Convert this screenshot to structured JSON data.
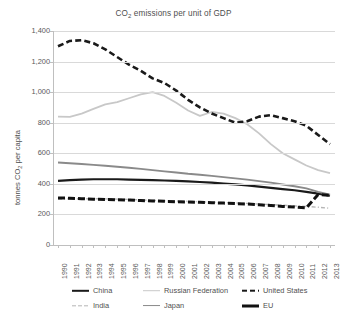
{
  "chart_data": {
    "type": "line",
    "title": "CO2 emissions per unit of GDP",
    "title_main": "CO",
    "title_sub": "2",
    "title_rest": " emissions per unit of GDP",
    "xlabel": "",
    "ylabel": "tonnes CO2 per capita",
    "ylabel_main": "tonnes CO",
    "ylabel_sub": "2",
    "ylabel_rest": " per capita",
    "ylim": [
      0,
      1400
    ],
    "ytick_labels": [
      "1,400",
      "1,200",
      "1,000",
      "800",
      "600",
      "400",
      "200",
      "0"
    ],
    "ytick_values": [
      1400,
      1200,
      1000,
      800,
      600,
      400,
      200,
      0
    ],
    "grid": true,
    "legend_position": "bottom",
    "x": [
      1990,
      1991,
      1992,
      1993,
      1994,
      1995,
      1996,
      1997,
      1998,
      1999,
      2000,
      2001,
      2002,
      2003,
      2004,
      2005,
      2006,
      2007,
      2008,
      2009,
      2010,
      2011,
      2012,
      2013
    ],
    "categories": [
      "1990",
      "1991",
      "1992",
      "1993",
      "1994",
      "1995",
      "1996",
      "1997",
      "1998",
      "1999",
      "2000",
      "2001",
      "2002",
      "2003",
      "2004",
      "2005",
      "2006",
      "2007",
      "2008",
      "2009",
      "2010",
      "2011",
      "2012",
      "2013"
    ],
    "series": [
      {
        "name": "China",
        "color": "#1a1a1a",
        "style": "solid",
        "width": 2.2,
        "values": [
          420,
          424,
          428,
          430,
          430,
          430,
          428,
          426,
          424,
          422,
          420,
          416,
          412,
          408,
          402,
          396,
          390,
          382,
          374,
          366,
          358,
          348,
          336,
          322
        ]
      },
      {
        "name": "Russian Federation",
        "color": "#c8c8c8",
        "style": "solid",
        "width": 1.8,
        "values": [
          840,
          838,
          860,
          890,
          920,
          935,
          960,
          985,
          1000,
          975,
          930,
          880,
          845,
          870,
          860,
          830,
          790,
          730,
          660,
          600,
          560,
          520,
          490,
          470
        ]
      },
      {
        "name": "United States",
        "color": "#1a1a1a",
        "style": "dashed",
        "width": 2.6,
        "values": [
          1300,
          1335,
          1340,
          1320,
          1280,
          1230,
          1180,
          1140,
          1090,
          1060,
          1010,
          950,
          900,
          860,
          830,
          800,
          810,
          840,
          850,
          830,
          810,
          780,
          720,
          660
        ]
      },
      {
        "name": "India",
        "color": "#b5b5b5",
        "style": "dash-dot",
        "width": 1.4,
        "values": [
          300,
          302,
          303,
          303,
          302,
          300,
          298,
          295,
          292,
          290,
          288,
          286,
          283,
          280,
          278,
          275,
          272,
          268,
          264,
          260,
          256,
          252,
          247,
          240
        ]
      },
      {
        "name": "Japan",
        "color": "#8a8a8a",
        "style": "solid",
        "width": 1.9,
        "values": [
          540,
          535,
          530,
          524,
          518,
          512,
          505,
          498,
          490,
          482,
          474,
          466,
          460,
          452,
          444,
          436,
          428,
          418,
          408,
          396,
          384,
          370,
          348,
          330
        ]
      },
      {
        "name": "EU",
        "color": "#111111",
        "style": "long-dash",
        "width": 3.0,
        "values": [
          308,
          306,
          303,
          300,
          298,
          296,
          294,
          291,
          288,
          286,
          283,
          281,
          279,
          277,
          274,
          271,
          268,
          263,
          258,
          252,
          248,
          243,
          330,
          325
        ]
      }
    ]
  },
  "legend": {
    "items": [
      {
        "label": "China",
        "swatch": "sw-solid-black"
      },
      {
        "label": "Russian Federation",
        "swatch": "sw-solid-gray"
      },
      {
        "label": "United States",
        "swatch": "sw-dash-black"
      },
      {
        "label": "India",
        "swatch": "sw-dash-light"
      },
      {
        "label": "Japan",
        "swatch": "sw-solid-midgray"
      },
      {
        "label": "EU",
        "swatch": "sw-solid-thick"
      }
    ]
  }
}
